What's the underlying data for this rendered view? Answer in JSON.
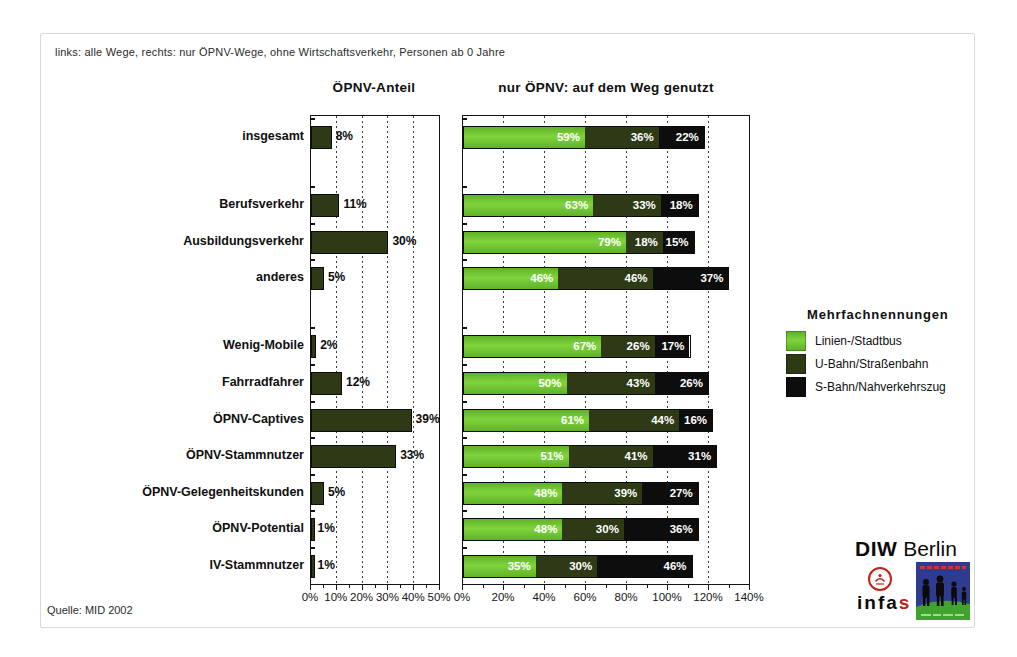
{
  "note": "links: alle Wege, rechts: nur ÖPNV-Wege, ohne Wirtschaftsverkehr, Personen ab 0 Jahre",
  "source": "Quelle: MID 2002",
  "legend": {
    "title": "Mehrfachnennungen",
    "items": [
      {
        "label": "Linien-/Stadtbus",
        "color": "#6ec42d"
      },
      {
        "label": "U-Bahn/Straßenbahn",
        "color": "#2e3a16"
      },
      {
        "label": "S-Bahn/Nahverkehrszug",
        "color": "#0d0d0d"
      }
    ]
  },
  "logos": {
    "diw_bold": "DIW",
    "diw_rest": " Berlin",
    "infas_black": "infa",
    "infas_red": "s"
  },
  "chart_data": [
    {
      "type": "bar",
      "title": "ÖPNV-Anteil",
      "xlabel": "",
      "xlim": [
        0,
        50
      ],
      "ticks": [
        0,
        10,
        20,
        30,
        40,
        50
      ],
      "tick_labels": [
        "0%",
        "10%",
        "20%",
        "30%",
        "40%",
        "50%"
      ],
      "bar_color": "#2e3a16",
      "grid": "dashed-vertical",
      "unit": "%",
      "groups": [
        {
          "rows": [
            {
              "label": "insgesamt",
              "value": 8
            }
          ]
        },
        {
          "rows": [
            {
              "label": "Berufsverkehr",
              "value": 11
            },
            {
              "label": "Ausbildungsverkehr",
              "value": 30
            },
            {
              "label": "anderes",
              "value": 5
            }
          ]
        },
        {
          "rows": [
            {
              "label": "Wenig-Mobile",
              "value": 2
            },
            {
              "label": "Fahrradfahrer",
              "value": 12
            },
            {
              "label": "ÖPNV-Captives",
              "value": 39
            },
            {
              "label": "ÖPNV-Stammnutzer",
              "value": 33
            },
            {
              "label": "ÖPNV-Gelegenheitskunden",
              "value": 5
            },
            {
              "label": "ÖPNV-Potential",
              "value": 1
            },
            {
              "label": "IV-Stammnutzer",
              "value": 1
            }
          ]
        }
      ]
    },
    {
      "type": "stacked-bar",
      "title": "nur ÖPNV: auf dem Weg genutzt",
      "xlim": [
        0,
        140
      ],
      "ticks": [
        0,
        20,
        40,
        60,
        80,
        100,
        120,
        140
      ],
      "tick_labels": [
        "0%",
        "20%",
        "40%",
        "60%",
        "80%",
        "100%",
        "120%",
        "140%"
      ],
      "series": [
        "Linien-/Stadtbus",
        "U-Bahn/Straßenbahn",
        "S-Bahn/Nahverkehrszug"
      ],
      "series_colors": [
        "#6ec42d",
        "#2e3a16",
        "#0d0d0d"
      ],
      "grid": "dashed-vertical",
      "legend_position": "right",
      "unit": "%",
      "groups": [
        {
          "rows": [
            {
              "label": "insgesamt",
              "values": [
                59,
                36,
                22
              ]
            }
          ]
        },
        {
          "rows": [
            {
              "label": "Berufsverkehr",
              "values": [
                63,
                33,
                18
              ]
            },
            {
              "label": "Ausbildungsverkehr",
              "values": [
                79,
                18,
                15
              ]
            },
            {
              "label": "anderes",
              "values": [
                46,
                46,
                37
              ]
            }
          ]
        },
        {
          "rows": [
            {
              "label": "Wenig-Mobile",
              "values": [
                67,
                26,
                17
              ]
            },
            {
              "label": "Fahrradfahrer",
              "values": [
                50,
                43,
                26
              ]
            },
            {
              "label": "ÖPNV-Captives",
              "values": [
                61,
                44,
                16
              ]
            },
            {
              "label": "ÖPNV-Stammnutzer",
              "values": [
                51,
                41,
                31
              ]
            },
            {
              "label": "ÖPNV-Gelegenheitskunden",
              "values": [
                48,
                39,
                27
              ]
            },
            {
              "label": "ÖPNV-Potential",
              "values": [
                48,
                30,
                36
              ]
            },
            {
              "label": "IV-Stammnutzer",
              "values": [
                35,
                30,
                46
              ]
            }
          ]
        }
      ]
    }
  ]
}
